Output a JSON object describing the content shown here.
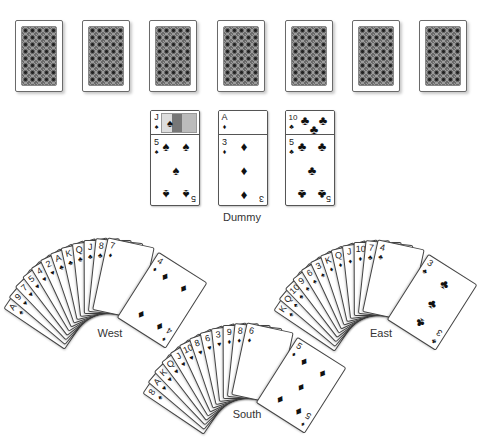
{
  "table": {
    "background": "#ffffff",
    "card_back_count": 7,
    "card_backs": [
      {
        "id": "back-1"
      },
      {
        "id": "back-2"
      },
      {
        "id": "back-3"
      },
      {
        "id": "back-4"
      },
      {
        "id": "back-5"
      },
      {
        "id": "back-6"
      },
      {
        "id": "back-7"
      }
    ]
  },
  "dummy": {
    "label": "Dummy",
    "columns": [
      {
        "top": {
          "rank": "J",
          "suit": "♠"
        },
        "bottom": {
          "rank": "5",
          "suit": "♠"
        }
      },
      {
        "top": {
          "rank": "A",
          "suit": "♦"
        },
        "bottom": {
          "rank": "3",
          "suit": "♦"
        }
      },
      {
        "top": {
          "rank": "10",
          "suit": "♣"
        },
        "bottom": {
          "rank": "5",
          "suit": "♣"
        }
      }
    ]
  },
  "hands": {
    "west": {
      "label": "West",
      "cards": [
        {
          "rank": "A",
          "suit": "♠"
        },
        {
          "rank": "9",
          "suit": "♥"
        },
        {
          "rank": "7",
          "suit": "♥"
        },
        {
          "rank": "5",
          "suit": "♥"
        },
        {
          "rank": "4",
          "suit": "♥"
        },
        {
          "rank": "2",
          "suit": "♥"
        },
        {
          "rank": "A",
          "suit": "♣"
        },
        {
          "rank": "K",
          "suit": "♣"
        },
        {
          "rank": "Q",
          "suit": "♣"
        },
        {
          "rank": "J",
          "suit": "♣"
        },
        {
          "rank": "8",
          "suit": "♣"
        },
        {
          "rank": "7",
          "suit": "♦"
        },
        {
          "rank": "4",
          "suit": "♦"
        }
      ]
    },
    "east": {
      "label": "East",
      "cards": [
        {
          "rank": "K",
          "suit": "♠"
        },
        {
          "rank": "Q",
          "suit": "♠"
        },
        {
          "rank": "10",
          "suit": "♠"
        },
        {
          "rank": "9",
          "suit": "♠"
        },
        {
          "rank": "6",
          "suit": "♠"
        },
        {
          "rank": "3",
          "suit": "♠"
        },
        {
          "rank": "K",
          "suit": "♦"
        },
        {
          "rank": "Q",
          "suit": "♦"
        },
        {
          "rank": "J",
          "suit": "♦"
        },
        {
          "rank": "10",
          "suit": "♦"
        },
        {
          "rank": "7",
          "suit": "♣"
        },
        {
          "rank": "4",
          "suit": "♣"
        },
        {
          "rank": "3",
          "suit": "♣"
        }
      ]
    },
    "south": {
      "label": "South",
      "cards": [
        {
          "rank": "8",
          "suit": "♠"
        },
        {
          "rank": "A",
          "suit": "♥"
        },
        {
          "rank": "K",
          "suit": "♥"
        },
        {
          "rank": "Q",
          "suit": "♥"
        },
        {
          "rank": "J",
          "suit": "♥"
        },
        {
          "rank": "10",
          "suit": "♥"
        },
        {
          "rank": "8",
          "suit": "♥"
        },
        {
          "rank": "6",
          "suit": "♥"
        },
        {
          "rank": "3",
          "suit": "♥"
        },
        {
          "rank": "9",
          "suit": "♦"
        },
        {
          "rank": "8",
          "suit": "♦"
        },
        {
          "rank": "6",
          "suit": "♦"
        },
        {
          "rank": "5",
          "suit": "♦"
        }
      ]
    }
  }
}
